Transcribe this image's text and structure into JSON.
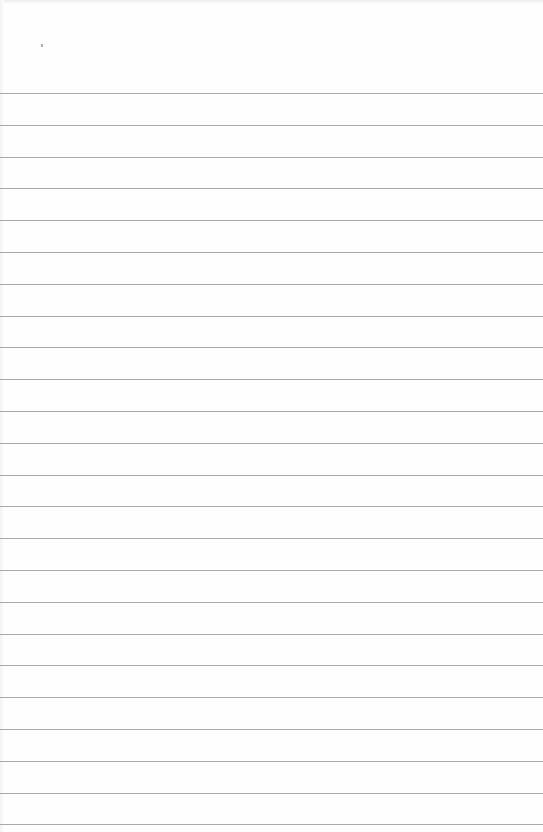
{
  "paper": {
    "type": "lined notebook paper",
    "background_color": "#fefefe",
    "rule_color": "#9a9a9a",
    "first_rule_y": 93,
    "rule_spacing": 31.8,
    "rule_count": 24
  }
}
